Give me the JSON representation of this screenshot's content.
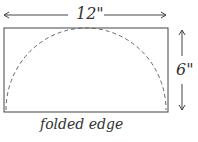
{
  "diagram": {
    "width_label": "12\"",
    "height_label": "6\"",
    "edge_label": "folded edge",
    "stroke_color": "#444444"
  }
}
